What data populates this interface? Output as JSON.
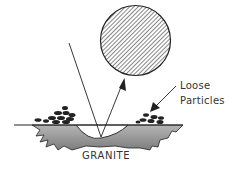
{
  "diagram": {
    "labels": {
      "loose": "Loose",
      "particles": "Particles",
      "granite": "GRANITE"
    },
    "elements": {
      "projectile": "hatched circle (particle/ball)",
      "incident_line": "incoming trajectory",
      "rebound_arrow": "rebound trajectory arrow",
      "surface_line": "ground surface",
      "crater": "impact crater in granite",
      "loose_particles_left": "pile of loose particles (left)",
      "loose_particles_right": "pile of loose particles (right)"
    },
    "colors": {
      "ink": "#222222",
      "granite_fill": "#9a9a9a",
      "background": "#ffffff"
    }
  }
}
